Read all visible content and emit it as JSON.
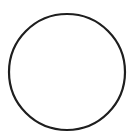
{
  "canvas": {
    "width": 134,
    "height": 138,
    "background": "#ffffff"
  },
  "shape": {
    "type": "circle",
    "cx": 67,
    "cy": 72,
    "r": 58,
    "stroke": "#1e1e1e",
    "stroke_width": 2.2,
    "fill": "none"
  }
}
